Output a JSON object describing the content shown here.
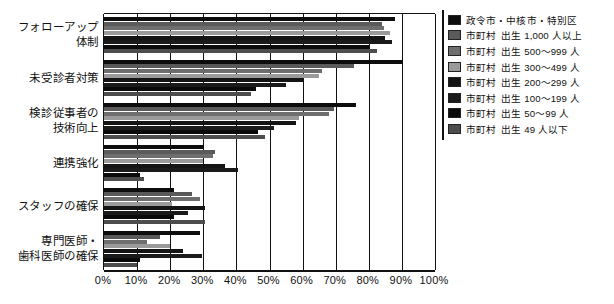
{
  "chart_data": {
    "type": "bar",
    "orientation": "horizontal",
    "title": "",
    "xlabel": "",
    "ylabel": "",
    "xlim": [
      0,
      100
    ],
    "xticks": [
      "0%",
      "10%",
      "20%",
      "30%",
      "40%",
      "50%",
      "60%",
      "70%",
      "80%",
      "90%",
      "100%"
    ],
    "grid": true,
    "legend_position": "right",
    "categories": [
      "フォローアップ\n体制",
      "未受診者対策",
      "検診従事者の\n技術向上",
      "連携強化",
      "スタッフの確保",
      "専門医師・\n歯科医師の確保"
    ],
    "series": [
      {
        "name": "政令市・中核市・特別区",
        "color": "#0d0d0d",
        "values": [
          88.0,
          90.0,
          76.0,
          30.0,
          21.0,
          29.0
        ]
      },
      {
        "name": "市町村　出生 1,000 人以上",
        "color": "#5a5a5a",
        "values": [
          84.0,
          75.5,
          69.5,
          33.5,
          26.5,
          17.0
        ]
      },
      {
        "name": "市町村　出生 500〜999 人",
        "color": "#6e6e6e",
        "values": [
          84.5,
          66.0,
          68.0,
          33.0,
          29.0,
          13.0
        ]
      },
      {
        "name": "市町村　出生 300〜499 人",
        "color": "#9a9a9a",
        "values": [
          86.5,
          65.0,
          59.0,
          30.0,
          20.5,
          20.0
        ]
      },
      {
        "name": "市町村　出生 200〜299 人",
        "color": "#141414",
        "values": [
          85.0,
          60.5,
          58.0,
          36.5,
          30.5,
          24.0
        ]
      },
      {
        "name": "市町村　出生 100〜199 人",
        "color": "#1a1a1a",
        "values": [
          87.0,
          55.0,
          51.5,
          40.5,
          25.5,
          29.5
        ]
      },
      {
        "name": "市町村　出生 50〜99 人",
        "color": "#0a0a0a",
        "values": [
          80.0,
          46.0,
          46.5,
          11.0,
          21.0,
          11.0
        ]
      },
      {
        "name": "市町村　出生 49 人以下",
        "color": "#4d4d4d",
        "values": [
          82.5,
          44.5,
          48.5,
          12.0,
          30.5,
          10.0
        ]
      }
    ]
  },
  "legend": {
    "items": [
      {
        "label_a": "政令市・中核市・特別区",
        "label_b": "",
        "color": "#0d0d0d"
      },
      {
        "label_a": "市町村",
        "label_b": "出生 1,000 人以上",
        "color": "#5a5a5a"
      },
      {
        "label_a": "市町村",
        "label_b": "出生 500〜999 人",
        "color": "#6e6e6e"
      },
      {
        "label_a": "市町村",
        "label_b": "出生 300〜499 人",
        "color": "#9a9a9a"
      },
      {
        "label_a": "市町村",
        "label_b": "出生 200〜299 人",
        "color": "#141414"
      },
      {
        "label_a": "市町村",
        "label_b": "出生 100〜199 人",
        "color": "#1a1a1a"
      },
      {
        "label_a": "市町村",
        "label_b": "出生 50〜99 人",
        "color": "#0a0a0a"
      },
      {
        "label_a": "市町村",
        "label_b": "出生 49 人以下",
        "color": "#4d4d4d"
      }
    ]
  },
  "axis": {
    "x_tick_labels": [
      "0%",
      "10%",
      "20%",
      "30%",
      "40%",
      "50%",
      "60%",
      "70%",
      "80%",
      "90%",
      "100%"
    ]
  },
  "categories_display": [
    {
      "line1": "フォローアップ",
      "line2": "体制"
    },
    {
      "line1": "未受診者対策",
      "line2": ""
    },
    {
      "line1": "検診従事者の",
      "line2": "技術向上"
    },
    {
      "line1": "連携強化",
      "line2": ""
    },
    {
      "line1": "スタッフの確保",
      "line2": ""
    },
    {
      "line1": "専門医師・",
      "line2": "歯科医師の確保"
    }
  ]
}
